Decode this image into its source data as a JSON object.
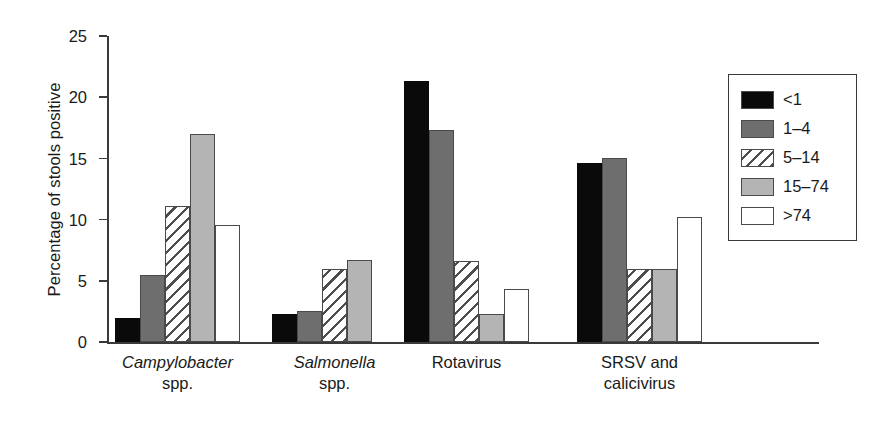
{
  "chart_data": {
    "type": "bar",
    "title": "",
    "xlabel": "",
    "ylabel": "Percentage of stools positive",
    "ylim": [
      0,
      25
    ],
    "yticks": [
      0,
      5,
      10,
      15,
      20,
      25
    ],
    "ytick_labels": [
      "0",
      "5",
      "10",
      "15",
      "20",
      "25"
    ],
    "grid": false,
    "legend_position": "right-outside",
    "legend_title": "",
    "categories": [
      "Campylobacter spp.",
      "Salmonella spp.",
      "Rotavirus",
      "SRSV and calicivirus"
    ],
    "category_labels": [
      {
        "line1": "Campylobacter",
        "line1_italic": true,
        "line2": "spp.",
        "line2_italic": false
      },
      {
        "line1": "Salmonella",
        "line1_italic": true,
        "line2": "spp.",
        "line2_italic": false
      },
      {
        "line1": "Rotavirus",
        "line1_italic": false,
        "line2": "",
        "line2_italic": false
      },
      {
        "line1": "SRSV and",
        "line1_italic": false,
        "line2": "calicivirus",
        "line2_italic": false
      }
    ],
    "series": [
      {
        "name": "<1",
        "fill": "solid-black",
        "color": "#0a0a0a",
        "values": [
          2.0,
          2.3,
          21.3,
          14.6
        ]
      },
      {
        "name": "1–4",
        "fill": "solid-dark-gray",
        "color": "#6e6e6e",
        "values": [
          5.5,
          2.5,
          17.3,
          15.0
        ]
      },
      {
        "name": "5–14",
        "fill": "diagonal-hatch",
        "color": "#ffffff",
        "values": [
          11.1,
          6.0,
          6.6,
          6.0
        ]
      },
      {
        "name": "15–74",
        "fill": "solid-light-gray",
        "color": "#b4b4b4",
        "values": [
          17.0,
          6.7,
          2.3,
          6.0
        ]
      },
      {
        "name": ">74",
        "fill": "solid-white",
        "color": "#ffffff",
        "values": [
          9.6,
          0.0,
          4.3,
          10.2
        ]
      }
    ]
  },
  "legend": {
    "items": [
      {
        "label": "<1",
        "swatch": "swatch-solid-black"
      },
      {
        "label": "1–4",
        "swatch": "swatch-solid-dark-gray"
      },
      {
        "label": "5–14",
        "swatch": "swatch-diagonal-hatch"
      },
      {
        "label": "15–74",
        "swatch": "swatch-solid-light-gray"
      },
      {
        "label": ">74",
        "swatch": "swatch-solid-white"
      }
    ]
  },
  "colors": {
    "axis": "#3a3a3a",
    "bar_outline": "#4a4a4a",
    "series_lt1": "#0a0a0a",
    "series_1_4": "#6e6e6e",
    "series_5_14": "#ffffff",
    "series_15_74": "#b4b4b4",
    "series_gt74": "#ffffff",
    "background": "#ffffff"
  }
}
